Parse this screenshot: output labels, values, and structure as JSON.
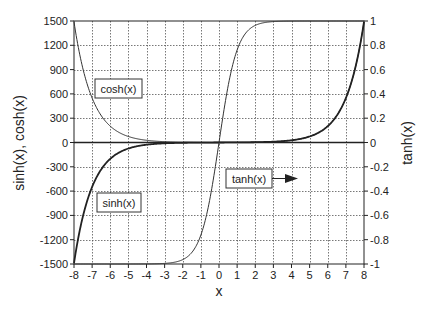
{
  "chart_data": {
    "type": "line",
    "title": "",
    "xlabel": "x",
    "ylabel_left": "sinh(x), cosh(x)",
    "ylabel_right": "tanh(x)",
    "xlim": [
      -8,
      8
    ],
    "ylim_left": [
      -1500,
      1500
    ],
    "ylim_right": [
      -1,
      1
    ],
    "grid": true,
    "x_ticks": [
      -8,
      -7,
      -6,
      -5,
      -4,
      -3,
      -2,
      -1,
      0,
      1,
      2,
      3,
      4,
      5,
      6,
      7,
      8
    ],
    "y_left_ticks": [
      -1500,
      -1200,
      -900,
      -600,
      -300,
      0,
      300,
      600,
      900,
      1200,
      1500
    ],
    "y_right_ticks": [
      -1,
      -0.8,
      -0.6,
      -0.4,
      -0.2,
      0,
      0.2,
      0.4,
      0.6,
      0.8,
      1
    ],
    "series": [
      {
        "name": "cosh(x)",
        "axis": "left",
        "function": "cosh",
        "x": [
          -8,
          -7,
          -6,
          -5,
          -4,
          -3,
          -2,
          -1,
          0,
          1,
          2,
          3,
          4,
          5,
          6,
          7,
          8
        ],
        "values": [
          1490.5,
          548.3,
          201.7,
          74.2,
          27.3,
          10.1,
          3.8,
          1.5,
          1,
          1.5,
          3.8,
          10.1,
          27.3,
          74.2,
          201.7,
          548.3,
          1490.5
        ]
      },
      {
        "name": "sinh(x)",
        "axis": "left",
        "function": "sinh",
        "x": [
          -8,
          -7,
          -6,
          -5,
          -4,
          -3,
          -2,
          -1,
          0,
          1,
          2,
          3,
          4,
          5,
          6,
          7,
          8
        ],
        "values": [
          -1490.5,
          -548.3,
          -201.7,
          -74.2,
          -27.3,
          -10.0,
          -3.6,
          -1.2,
          0,
          1.2,
          3.6,
          10.0,
          27.3,
          74.2,
          201.7,
          548.3,
          1490.5
        ]
      },
      {
        "name": "tanh(x)",
        "axis": "right",
        "function": "tanh",
        "x": [
          -8,
          -7,
          -6,
          -5,
          -4,
          -3,
          -2,
          -1,
          0,
          1,
          2,
          3,
          4,
          5,
          6,
          7,
          8
        ],
        "values": [
          -1,
          -1,
          -1,
          -1,
          -0.999,
          -0.995,
          -0.964,
          -0.762,
          0,
          0.762,
          0.964,
          0.995,
          0.999,
          1,
          1,
          1,
          1
        ]
      }
    ],
    "annotations": [
      {
        "text": "cosh(x)",
        "box": true
      },
      {
        "text": "sinh(x)",
        "box": true
      },
      {
        "text": "tanh(x)",
        "box": true,
        "arrow": "right"
      }
    ],
    "legend": "none (inline boxed labels)"
  }
}
